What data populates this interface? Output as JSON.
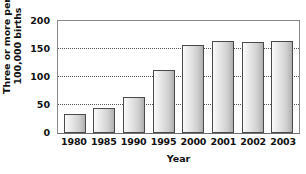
{
  "chart_data": {
    "type": "bar",
    "title": "",
    "xlabel": "Year",
    "ylabel": "Three or more per 100,000 births",
    "ylabel_line1": "Three or more per",
    "ylabel_line2": "100,000 births",
    "categories": [
      "1980",
      "1985",
      "1990",
      "1995",
      "2000",
      "2001",
      "2002",
      "2003"
    ],
    "values": [
      34,
      45,
      64,
      112,
      158,
      164,
      162,
      164
    ],
    "ylim": [
      0,
      200
    ],
    "yticks": [
      0,
      50,
      100,
      150,
      200
    ],
    "ytick_labels": [
      "0",
      "50",
      "100",
      "150",
      "200"
    ],
    "grid": "horizontal-dotted",
    "gridline_values": [
      50,
      100,
      150
    ],
    "legend": "none",
    "series_name": "Three or more per 100,000 births",
    "bar_fill_light": "#fbfbfb",
    "bar_fill_dark": "#aeaeae",
    "bar_border_color": "#4a4a4a",
    "axis_color": "#8a8a8a",
    "grid_color": "#555555",
    "text_color": "#111111",
    "background": "#ffffff"
  }
}
